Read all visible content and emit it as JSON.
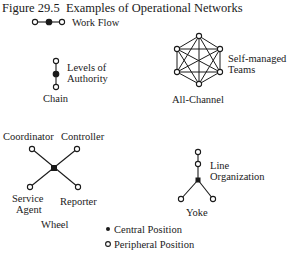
{
  "figure": {
    "label": "Figure 29.5",
    "title": "Examples of Operational Networks"
  },
  "work_flow": {
    "label": "Work Flow"
  },
  "chain": {
    "side_label_line1": "Levels of",
    "side_label_line2": "Authority",
    "name": "Chain"
  },
  "all_channel": {
    "side_label_line1": "Self-managed",
    "side_label_line2": "Teams",
    "name": "All-Channel"
  },
  "wheel": {
    "node_labels": {
      "top_left": "Coordinator",
      "top_right": "Controller",
      "bottom_left_line1": "Service",
      "bottom_left_line2": "Agent",
      "bottom_right": "Reporter"
    },
    "name": "Wheel"
  },
  "yoke": {
    "side_label_line1": "Line",
    "side_label_line2": "Organization",
    "name": "Yoke"
  },
  "legend": {
    "items": [
      {
        "symbol": "filled-circle",
        "label": "Central Position"
      },
      {
        "symbol": "open-circle",
        "label": "Peripheral Position"
      }
    ]
  },
  "colors": {
    "ink": "#1a1a1a",
    "background": "#ffffff"
  }
}
